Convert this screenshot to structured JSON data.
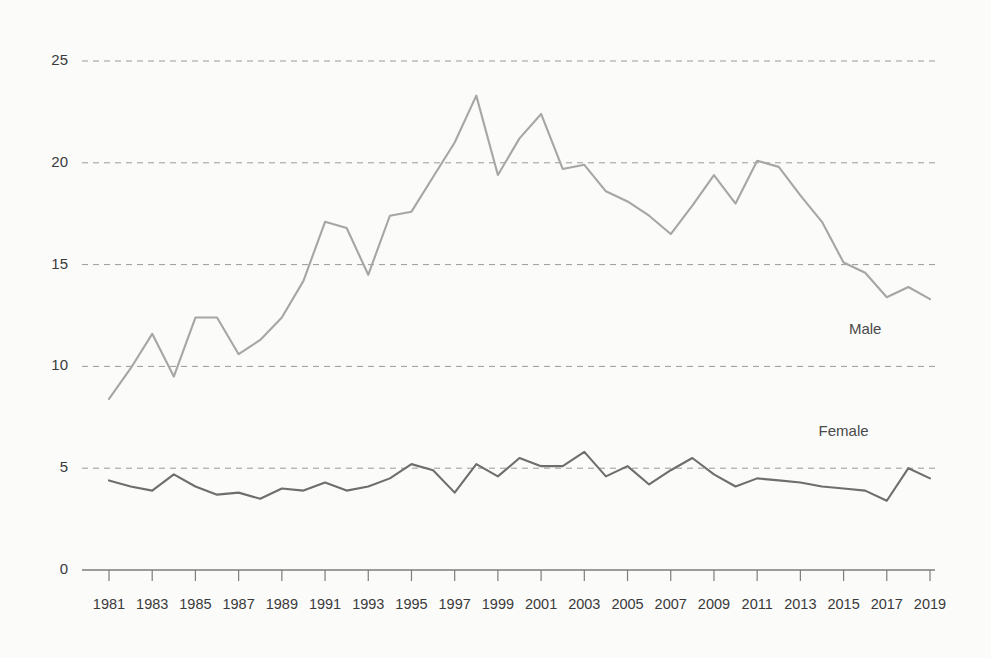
{
  "chart_data": {
    "type": "line",
    "title": "",
    "subtitle": "",
    "xlabel": "",
    "ylabel": "",
    "xlim": [
      1981,
      2019
    ],
    "ylim": [
      0,
      25
    ],
    "grid": true,
    "grid_axis": "y",
    "legend_position": "inline-right",
    "y_ticks": [
      0,
      5,
      10,
      15,
      20,
      25
    ],
    "y_tick_labels": [
      "0",
      "5",
      "10",
      "15",
      "20",
      "25"
    ],
    "x_tick_labels": [
      "1981",
      "1983",
      "1985",
      "1987",
      "1989",
      "1991",
      "1993",
      "1995",
      "1997",
      "1999",
      "2001",
      "2003",
      "2005",
      "2007",
      "2009",
      "2011",
      "2013",
      "2015",
      "2017",
      "2019"
    ],
    "x": [
      1981,
      1982,
      1983,
      1984,
      1985,
      1986,
      1987,
      1988,
      1989,
      1990,
      1991,
      1992,
      1993,
      1994,
      1995,
      1996,
      1997,
      1998,
      1999,
      2000,
      2001,
      2002,
      2003,
      2004,
      2005,
      2006,
      2007,
      2008,
      2009,
      2010,
      2011,
      2012,
      2013,
      2014,
      2015,
      2016,
      2017,
      2018,
      2019
    ],
    "series": [
      {
        "name": "Male",
        "color": "#a6a6a6",
        "label_x": 2016,
        "label_y": 11.6,
        "values": [
          8.4,
          9.9,
          11.6,
          9.5,
          12.4,
          12.4,
          10.6,
          11.3,
          12.4,
          14.2,
          17.1,
          16.8,
          14.5,
          17.4,
          17.6,
          19.3,
          21.0,
          23.3,
          19.4,
          21.2,
          22.4,
          19.7,
          19.9,
          18.6,
          18.1,
          17.4,
          16.5,
          17.9,
          19.4,
          18.0,
          20.1,
          19.8,
          18.4,
          17.1,
          15.1,
          14.6,
          13.4,
          13.9,
          13.3
        ]
      },
      {
        "name": "Female",
        "color": "#6e6e6e",
        "label_x": 2015,
        "label_y": 6.6,
        "values": [
          4.4,
          4.1,
          3.9,
          4.7,
          4.1,
          3.7,
          3.8,
          3.5,
          4.0,
          3.9,
          4.3,
          3.9,
          4.1,
          4.5,
          5.2,
          4.9,
          3.8,
          5.2,
          4.6,
          5.5,
          5.1,
          5.1,
          5.8,
          4.6,
          5.1,
          4.2,
          4.9,
          5.5,
          4.7,
          4.1,
          4.5,
          4.4,
          4.3,
          4.1,
          4.0,
          3.9,
          3.4,
          5.0,
          4.5
        ]
      }
    ]
  },
  "axis": {
    "y_axis_name": "value-axis",
    "x_axis_name": "year-axis"
  }
}
